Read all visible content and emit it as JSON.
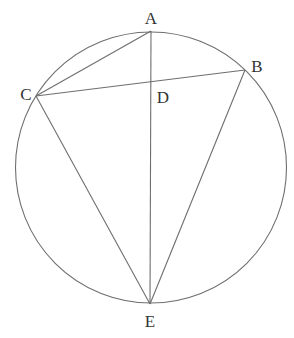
{
  "diagram": {
    "type": "circle-geometry",
    "circle": {
      "cx": 151,
      "cy": 167.5,
      "r": 135.5
    },
    "points": [
      {
        "id": "A",
        "label": "A",
        "x": 151,
        "y": 31,
        "lx": 151,
        "ly": 24
      },
      {
        "id": "B",
        "label": "B",
        "x": 245,
        "y": 70,
        "lx": 257,
        "ly": 72
      },
      {
        "id": "C",
        "label": "C",
        "x": 36,
        "y": 96,
        "lx": 26,
        "ly": 100
      },
      {
        "id": "D",
        "label": "D",
        "x": 151,
        "y": 82,
        "lx": 163,
        "ly": 103
      },
      {
        "id": "E",
        "label": "E",
        "x": 150,
        "y": 304,
        "lx": 150,
        "ly": 327
      }
    ],
    "segments": [
      [
        "A",
        "C"
      ],
      [
        "C",
        "B"
      ],
      [
        "A",
        "E"
      ],
      [
        "C",
        "E"
      ],
      [
        "B",
        "E"
      ]
    ],
    "colors": {
      "stroke": "#6e6e6e",
      "label": "#333333",
      "background": "#ffffff"
    }
  }
}
